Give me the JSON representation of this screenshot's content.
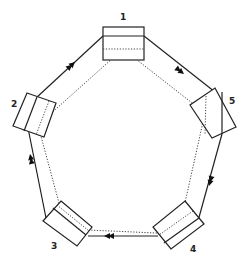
{
  "diagram": {
    "type": "ring",
    "nodes": [
      {
        "id": "1",
        "label": "1"
      },
      {
        "id": "2",
        "label": "2"
      },
      {
        "id": "3",
        "label": "3"
      },
      {
        "id": "4",
        "label": "4"
      },
      {
        "id": "5",
        "label": "5"
      }
    ],
    "outer_ring": {
      "style": "solid",
      "direction": [
        "2",
        "1",
        "5",
        "4",
        "3",
        "2"
      ],
      "arrow": "double-arrowhead"
    },
    "inner_ring": {
      "style": "dotted"
    }
  }
}
